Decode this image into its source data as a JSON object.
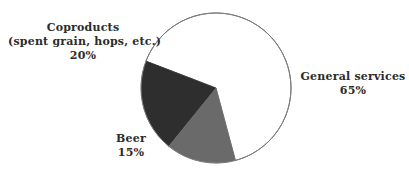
{
  "chart_data": {
    "type": "pie",
    "title": "",
    "subtitle": "",
    "xlabel": "",
    "ylabel": "",
    "legend_position": "none",
    "grid": false,
    "start_angle_deg": -69,
    "direction": "counterclockwise",
    "categories": [
      "General services",
      "Coproducts (spent grain, hops, etc.)",
      "Beer"
    ],
    "values": [
      65,
      20,
      15
    ],
    "unit": "%",
    "colors": [
      "#ffffff",
      "#2e2e2e",
      "#6a6a6a"
    ],
    "outline_color": "#7a7a7a",
    "slices": [
      {
        "name": "General services",
        "label_lines": [
          "General services",
          "65%"
        ],
        "value": 65,
        "value_label": "65%",
        "color": "#ffffff"
      },
      {
        "name": "Coproducts",
        "label_lines": [
          "Coproducts",
          "(spent grain, hops, etc.)",
          "20%"
        ],
        "value": 20,
        "value_label": "20%",
        "color": "#2e2e2e"
      },
      {
        "name": "Beer",
        "label_lines": [
          "Beer",
          "15%"
        ],
        "value": 15,
        "value_label": "15%",
        "color": "#6a6a6a"
      }
    ]
  },
  "labels": {
    "coproducts": {
      "line1": "Coproducts",
      "line2": "(spent grain, hops, etc.)",
      "line3": "20%"
    },
    "general_services": {
      "line1": "General services",
      "line2": "65%"
    },
    "beer": {
      "line1": "Beer",
      "line2": "15%"
    }
  },
  "style": {
    "background": "#ffffff",
    "text_color": "#2b2b2b",
    "slice_general": "#ffffff",
    "slice_coproducts": "#2e2e2e",
    "slice_beer": "#6a6a6a",
    "outline": "#7a7a7a"
  }
}
